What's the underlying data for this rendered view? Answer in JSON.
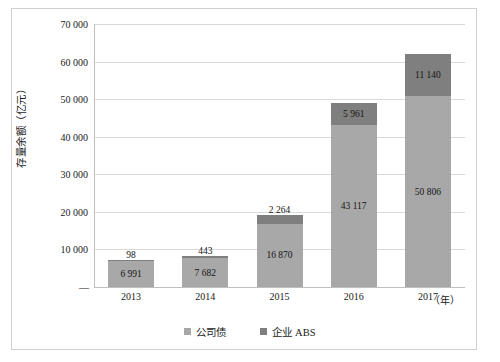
{
  "chart_data": {
    "type": "bar",
    "stacked": true,
    "title": "",
    "xlabel": "（年）",
    "ylabel": "存量余额（亿元）",
    "categories": [
      "2013",
      "2014",
      "2015",
      "2016",
      "2017"
    ],
    "series": [
      {
        "name": "公司债",
        "color": "#a8a8a8",
        "values": [
          6991,
          7682,
          16870,
          43117,
          50806
        ],
        "labels": [
          "6 991",
          "7 682",
          "16 870",
          "43 117",
          "50 806"
        ]
      },
      {
        "name": "企业 ABS",
        "color": "#7f7f7f",
        "values": [
          98,
          443,
          2264,
          5961,
          11140
        ],
        "labels": [
          "98",
          "443",
          "2 264",
          "5 961",
          "11 140"
        ]
      }
    ],
    "ylim": [
      0,
      70000
    ],
    "ytick_values": [
      70000,
      60000,
      50000,
      40000,
      30000,
      20000,
      10000,
      0
    ],
    "ytick_labels": [
      "70 000",
      "60 000",
      "50 000",
      "40 000",
      "30 000",
      "20 000",
      "10 000",
      "—"
    ],
    "grid": true,
    "legend_position": "bottom-center"
  },
  "axes": {
    "y_title": "存量余额（亿元）",
    "x_unit": "（年）"
  },
  "legend": {
    "items": [
      {
        "label": "公司债",
        "color": "#a8a8a8"
      },
      {
        "label": "企业 ABS",
        "color": "#7f7f7f"
      }
    ]
  }
}
